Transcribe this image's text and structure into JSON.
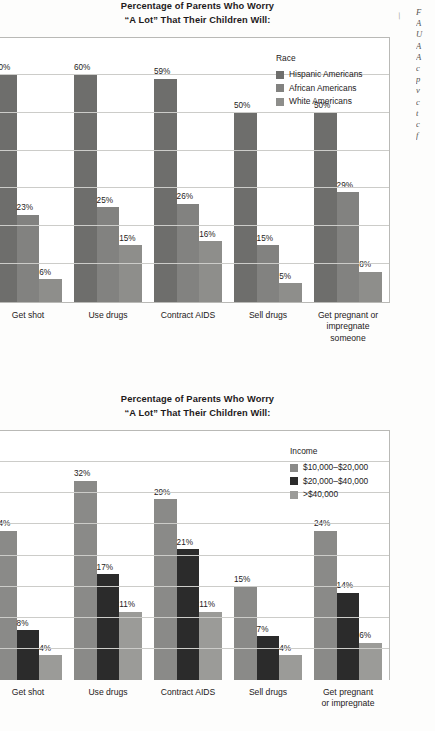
{
  "page": {
    "margin_note_lines": "F\nA\nU\nA\nA\nc\np\nv\nc\nt\nc\nf",
    "tick_glyph": "\\"
  },
  "charts": [
    {
      "id": "chart-race",
      "title": "Percentage of Parents Who Worry\n“A Lot” That Their Children Will:",
      "legend_title": "Race",
      "chart_data": {
        "type": "bar",
        "title": "Percentage of Parents Who Worry “A Lot” That Their Children Will:",
        "xlabel": "",
        "ylabel": "",
        "ylim": [
          0,
          70
        ],
        "grid": true,
        "legend_position": "top-right",
        "legend_title": "Race",
        "categories": [
          "Get shot",
          "Use drugs",
          "Contract AIDS",
          "Sell drugs",
          "Get pregnant or impregnate someone"
        ],
        "series": [
          {
            "name": "Hispanic Americans",
            "color": "#6e6e6c",
            "values": [
              60,
              60,
              59,
              50,
              50
            ],
            "labels": [
              "60%",
              "60%",
              "59%",
              "50%",
              "50%"
            ]
          },
          {
            "name": "African Americans",
            "color": "#828280",
            "values": [
              23,
              25,
              26,
              15,
              29
            ],
            "labels": [
              "23%",
              "25%",
              "26%",
              "15%",
              "29%"
            ]
          },
          {
            "name": "White Americans",
            "color": "#8e8e8b",
            "values": [
              6,
              15,
              16,
              5,
              8
            ],
            "labels": [
              "6%",
              "15%",
              "16%",
              "5%",
              "8%"
            ]
          }
        ]
      }
    },
    {
      "id": "chart-income",
      "title": "Percentage of Parents Who Worry\n“A Lot” That Their Children Will:",
      "legend_title": "Income",
      "chart_data": {
        "type": "bar",
        "title": "Percentage of Parents Who Worry “A Lot” That Their Children Will:",
        "xlabel": "",
        "ylabel": "",
        "ylim": [
          0,
          40
        ],
        "grid": true,
        "legend_position": "top-right",
        "legend_title": "Income",
        "categories": [
          "Get shot",
          "Use drugs",
          "Contract AIDS",
          "Sell drugs",
          "Get pregnant\nor impregnate"
        ],
        "series": [
          {
            "name": "$10,000–$20,000",
            "color": "#8a8a88",
            "values": [
              24,
              32,
              29,
              15,
              24
            ],
            "labels": [
              "24%",
              "32%",
              "29%",
              "15%",
              "24%"
            ]
          },
          {
            "name": "$20,000–$40,000",
            "color": "#2b2b2b",
            "values": [
              8,
              17,
              21,
              7,
              14
            ],
            "labels": [
              "8%",
              "17%",
              "21%",
              "7%",
              "14%"
            ]
          },
          {
            "name": ">$40,000",
            "color": "#9b9b98",
            "values": [
              4,
              11,
              11,
              4,
              6
            ],
            "labels": [
              "4%",
              "11%",
              "11%",
              "4%",
              "6%"
            ]
          }
        ]
      }
    }
  ]
}
